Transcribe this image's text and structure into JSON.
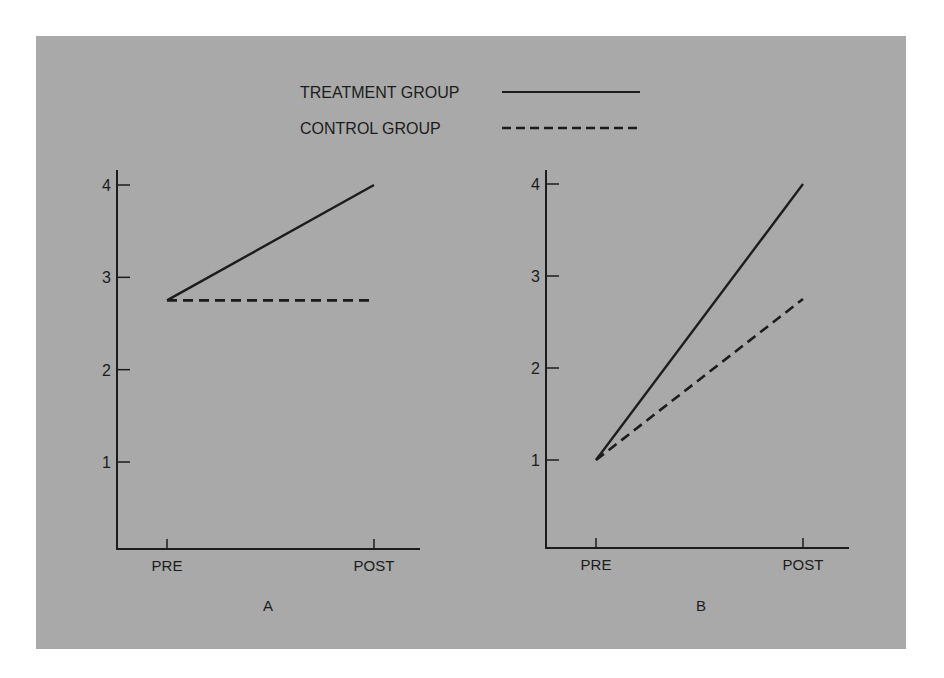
{
  "colors": {
    "panel_background": "#a9a9a9",
    "page_background": "#ffffff",
    "ink": "#1c1c1c"
  },
  "legend": {
    "items": [
      {
        "label": "TREATMENT GROUP",
        "style": "solid"
      },
      {
        "label": "CONTROL GROUP",
        "style": "dashed"
      }
    ]
  },
  "chart_data": [
    {
      "type": "line",
      "title": "A",
      "xlabel": "",
      "ylabel": "",
      "categories": [
        "PRE",
        "POST"
      ],
      "yticks": [
        1,
        2,
        3,
        4
      ],
      "ylim": [
        0,
        4.2
      ],
      "grid": false,
      "legend_position": "top-center (shared)",
      "series": [
        {
          "name": "TREATMENT GROUP",
          "style": "solid",
          "values": [
            2.75,
            4.0
          ]
        },
        {
          "name": "CONTROL GROUP",
          "style": "dashed",
          "values": [
            2.75,
            2.75
          ]
        }
      ]
    },
    {
      "type": "line",
      "title": "B",
      "xlabel": "",
      "ylabel": "",
      "categories": [
        "PRE",
        "POST"
      ],
      "yticks": [
        1,
        2,
        3,
        4
      ],
      "ylim": [
        0,
        4.2
      ],
      "grid": false,
      "legend_position": "top-center (shared)",
      "series": [
        {
          "name": "TREATMENT GROUP",
          "style": "solid",
          "values": [
            1.0,
            4.0
          ]
        },
        {
          "name": "CONTROL GROUP",
          "style": "dashed",
          "values": [
            1.0,
            2.75
          ]
        }
      ]
    }
  ]
}
